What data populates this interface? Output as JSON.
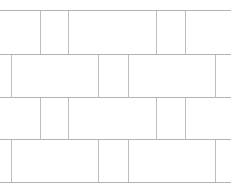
{
  "figure": {
    "kind": "tiling-diagram",
    "width": 231,
    "height": 190,
    "background_color": "#ffffff",
    "line_color_bed": "#b3b3b3",
    "line_color_head": "#bdbdbd",
    "line_width": 1,
    "edges_cropped": true
  },
  "geometry": {
    "bed_joints_y": [
      10,
      54,
      97,
      139,
      182
    ],
    "course_count": 4,
    "courses": [
      {
        "index": 1,
        "top": 10,
        "bottom": 54,
        "height": 44,
        "offset_group": "a",
        "head_joints_x": [
          40,
          68,
          156,
          185
        ]
      },
      {
        "index": 2,
        "top": 54,
        "bottom": 97,
        "height": 43,
        "offset_group": "b",
        "head_joints_x": [
          11,
          98,
          128,
          215
        ]
      },
      {
        "index": 3,
        "top": 97,
        "bottom": 139,
        "height": 42,
        "offset_group": "a",
        "head_joints_x": [
          40,
          68,
          156,
          185
        ]
      },
      {
        "index": 4,
        "top": 139,
        "bottom": 182,
        "height": 43,
        "offset_group": "b",
        "head_joints_x": [
          11,
          98,
          128,
          215
        ]
      }
    ]
  },
  "chart_data": {
    "type": "table",
    "xlabel": "",
    "ylabel": "",
    "columns": [
      "course",
      "top_y",
      "bottom_y",
      "head_joints_x"
    ],
    "rows": [
      [
        1,
        10,
        54,
        "40, 68, 156, 185"
      ],
      [
        2,
        54,
        97,
        "11, 98, 128, 215"
      ],
      [
        3,
        97,
        139,
        "40, 68, 156, 185"
      ],
      [
        4,
        139,
        182,
        "11, 98, 128, 215"
      ]
    ]
  }
}
